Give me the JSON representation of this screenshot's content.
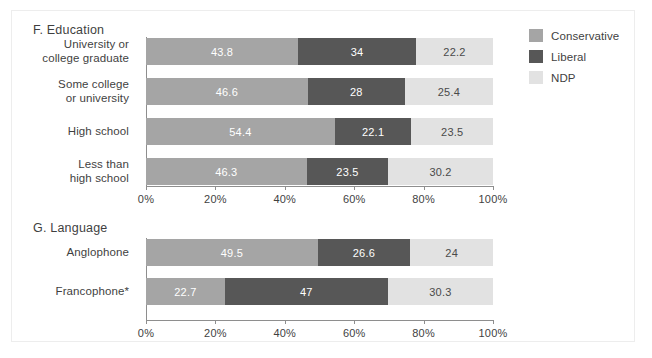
{
  "figure": {
    "background": "#ffffff",
    "border_color": "#ededed"
  },
  "legend": {
    "position": "top-right",
    "items": [
      {
        "label": "Conservative",
        "color": "#a5a5a5"
      },
      {
        "label": "Liberal",
        "color": "#575757"
      },
      {
        "label": "NDP",
        "color": "#e2e2e2"
      }
    ]
  },
  "panels": {
    "F": {
      "title": "F.  Education"
    },
    "G": {
      "title": "G.  Language"
    }
  },
  "axis": {
    "ticks": [
      "0%",
      "20%",
      "40%",
      "60%",
      "80%",
      "100%"
    ],
    "tick_values": [
      0,
      20,
      40,
      60,
      80,
      100
    ]
  },
  "chart_data": [
    {
      "type": "bar",
      "title": "F.  Education",
      "orientation": "horizontal",
      "stacked": true,
      "normalized_percent": true,
      "xlabel": "",
      "ylabel": "",
      "xlim": [
        0,
        100
      ],
      "grid": false,
      "legend_position": "top-right",
      "categories": [
        "University or college graduate",
        "Some college or university",
        "High school",
        "Less than high school"
      ],
      "category_lines": [
        [
          "University or",
          "college graduate"
        ],
        [
          "Some college",
          "or university"
        ],
        [
          "High school"
        ],
        [
          "Less than",
          "high school"
        ]
      ],
      "series": [
        {
          "name": "Conservative",
          "color": "#a5a5a5",
          "values": [
            43.8,
            46.6,
            54.4,
            46.3
          ]
        },
        {
          "name": "Liberal",
          "color": "#575757",
          "values": [
            34,
            28,
            22.1,
            23.5
          ]
        },
        {
          "name": "NDP",
          "color": "#e2e2e2",
          "values": [
            22.2,
            25.4,
            23.5,
            30.2
          ]
        }
      ],
      "bar_labels": [
        [
          "43.8",
          "34",
          "22.2"
        ],
        [
          "46.6",
          "28",
          "25.4"
        ],
        [
          "54.4",
          "22.1",
          "23.5"
        ],
        [
          "46.3",
          "23.5",
          "30.2"
        ]
      ],
      "tick_labels": [
        "0%",
        "20%",
        "40%",
        "60%",
        "80%",
        "100%"
      ]
    },
    {
      "type": "bar",
      "title": "G.  Language",
      "orientation": "horizontal",
      "stacked": true,
      "normalized_percent": true,
      "xlabel": "",
      "ylabel": "",
      "xlim": [
        0,
        100
      ],
      "grid": false,
      "legend_position": "top-right",
      "categories": [
        "Anglophone",
        "Francophone*"
      ],
      "category_lines": [
        [
          "Anglophone"
        ],
        [
          "Francophone*"
        ]
      ],
      "series": [
        {
          "name": "Conservative",
          "color": "#a5a5a5",
          "values": [
            49.5,
            22.7
          ]
        },
        {
          "name": "Liberal",
          "color": "#575757",
          "values": [
            26.6,
            47
          ]
        },
        {
          "name": "NDP",
          "color": "#e2e2e2",
          "values": [
            24,
            30.3
          ]
        }
      ],
      "bar_labels": [
        [
          "49.5",
          "26.6",
          "24"
        ],
        [
          "22.7",
          "47",
          "30.3"
        ]
      ],
      "tick_labels": [
        "0%",
        "20%",
        "40%",
        "60%",
        "80%",
        "100%"
      ]
    }
  ]
}
